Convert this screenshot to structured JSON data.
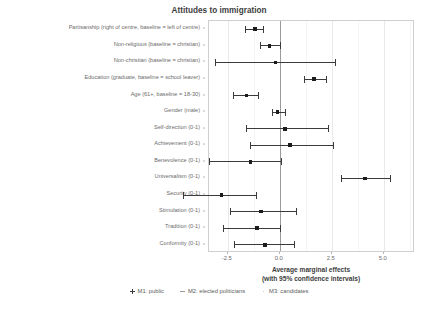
{
  "chart_data": {
    "type": "scatter",
    "title": "Attitudes to immigration",
    "xlabel_line1": "Average marginal effects",
    "xlabel_line2": "(with 95% confidence intervals)",
    "ylabel": "",
    "xlim": [
      -3.4,
      6.5
    ],
    "xticks": [
      -2.5,
      0.0,
      2.5,
      5.0
    ],
    "xticklabels": [
      "-2.5",
      "0.0",
      "2.5",
      "5.0"
    ],
    "grid": true,
    "zero_reference_line": 0.0,
    "legend_position": "bottom",
    "legend": [
      {
        "label": "M1: public",
        "marker": "plus-marker"
      },
      {
        "label": "M2: elected politicians",
        "marker": "dash-marker"
      },
      {
        "label": "M3: candidates",
        "marker": "blank-marker"
      }
    ],
    "categories": [
      "Partisanship (right of centre, baseline = left of centre)",
      "Non-religious (baseline = christian)",
      "Non-christian (baseline = christian)",
      "Education (graduate, baseline = school leaver)",
      "Age (61+, baseline = 18-30)",
      "Gender (male)",
      "Self-direction (0-1)",
      "Achievement (0-1)",
      "Benevolence (0-1)",
      "Universalism (0-1)",
      "Security (0-1)",
      "Stimulation (0-1)",
      "Tradition (0-1)",
      "Conformity (0-1)"
    ],
    "series": [
      {
        "name": "M1: public",
        "estimates": [
          -1.2,
          -0.5,
          -0.2,
          1.65,
          -1.6,
          -0.1,
          0.25,
          0.5,
          -1.4,
          4.1,
          -2.8,
          -0.9,
          -1.1,
          -0.7
        ],
        "ci_low": [
          -1.65,
          -0.95,
          -3.1,
          1.15,
          -2.25,
          -0.35,
          -1.6,
          -1.45,
          -3.4,
          2.95,
          -4.65,
          -2.4,
          -2.75,
          -2.2
        ],
        "ci_high": [
          -0.8,
          0.0,
          2.65,
          2.2,
          -1.05,
          0.25,
          2.3,
          2.55,
          0.05,
          5.3,
          -1.15,
          0.8,
          0.0,
          0.7
        ]
      }
    ]
  }
}
